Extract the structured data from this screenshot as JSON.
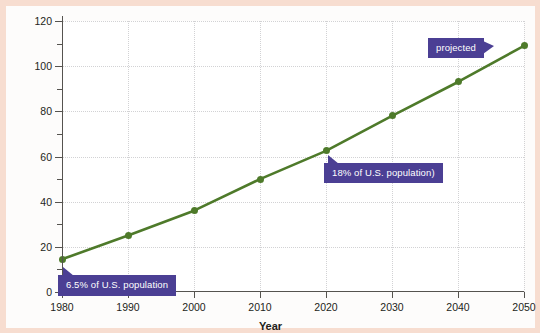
{
  "chart_data": {
    "type": "line",
    "title": "",
    "xlabel": "Year",
    "ylabel": "U.S. Population (millions)",
    "x": [
      1980,
      1990,
      2000,
      2010,
      2020,
      2030,
      2040,
      2050
    ],
    "values": [
      14.5,
      25,
      36,
      50,
      62.5,
      78,
      93,
      109
    ],
    "xlim": [
      1980,
      2050
    ],
    "ylim": [
      0,
      120
    ],
    "xticks": [
      "1980",
      "1990",
      "2000",
      "2010",
      "2020",
      "2030",
      "2040",
      "2050"
    ],
    "yticks": [
      "0",
      "20",
      "40",
      "60",
      "80",
      "100",
      "120"
    ],
    "y_minor_ticks": [
      10,
      30,
      50,
      70,
      90,
      110
    ],
    "grid": true,
    "legend": "none",
    "series_color": "#4e7a2a",
    "marker": "circle",
    "annotations": [
      {
        "id": "callout-6-5-percent",
        "text": "6.5% of U.S. population",
        "points_to_year": 1980,
        "points_to_value": 14.5
      },
      {
        "id": "callout-18-percent",
        "text": "18% of U.S. population)",
        "points_to_year": 2020,
        "points_to_value": 62.5
      },
      {
        "id": "callout-projected",
        "text": "projected",
        "points_to_year": 2050,
        "points_to_value": 109
      }
    ]
  },
  "colors": {
    "page_border": "#f7ddd0",
    "paper": "#fdfcfb",
    "line": "#4e7a2a",
    "callout": "#4b3f94",
    "axis": "#55534f",
    "grid": "#d2d2d4"
  },
  "bleed_text": {
    "line1": "",
    "line2": ""
  }
}
